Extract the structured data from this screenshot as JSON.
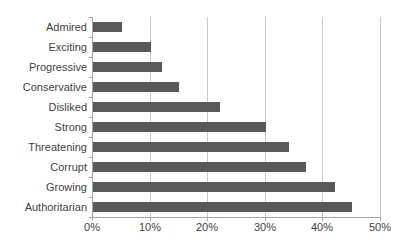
{
  "chart_data": {
    "type": "bar",
    "orientation": "horizontal",
    "title": "",
    "xlabel": "",
    "ylabel": "",
    "categories": [
      "Admired",
      "Exciting",
      "Progressive",
      "Conservative",
      "Disliked",
      "Strong",
      "Threatening",
      "Corrupt",
      "Growing",
      "Authoritarian"
    ],
    "values": [
      5,
      10,
      12,
      15,
      22,
      30,
      34,
      37,
      42,
      45
    ],
    "value_unit": "%",
    "xlim": [
      0,
      50
    ],
    "x_tick_step": 10,
    "x_tick_labels": [
      "0%",
      "10%",
      "20%",
      "30%",
      "40%",
      "50%"
    ],
    "grid": true,
    "legend": false,
    "colors": {
      "bar": "#595959",
      "gridline": "#c9c9c9",
      "axis": "#a6a6a6",
      "label_text": "#3f3f3f",
      "background": "#ffffff"
    }
  }
}
